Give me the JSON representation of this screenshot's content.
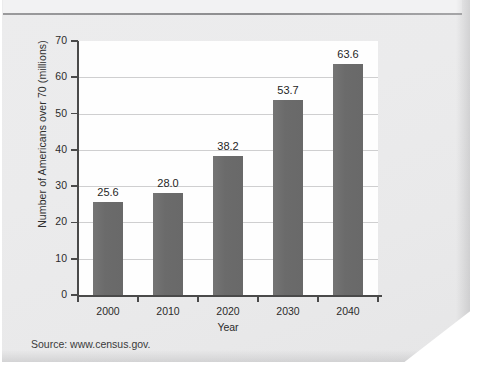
{
  "page": {
    "source_note": "Source: www.census.gov.",
    "paper_color": "#ebebec",
    "bar_color": "#6e6e6e",
    "axis_color": "#4a4a4a",
    "gridline_color": "#cfcfd0",
    "plot_background": "#fefefe"
  },
  "chart_data": {
    "type": "bar",
    "title": "",
    "xlabel": "Year",
    "ylabel": "Number of Americans over 70 (millions)",
    "categories": [
      "2000",
      "2010",
      "2020",
      "2030",
      "2040"
    ],
    "values": [
      25.6,
      28.0,
      38.2,
      53.7,
      63.6
    ],
    "value_labels": [
      "25.6",
      "28.0",
      "38.2",
      "53.7",
      "63.6"
    ],
    "ylim": [
      0,
      70
    ],
    "ytick_labels": [
      "70",
      "60",
      "50",
      "40",
      "30",
      "20",
      "10",
      "0"
    ],
    "ytick_values": [
      70,
      60,
      50,
      40,
      30,
      20,
      10,
      0
    ],
    "ytick_step": 10,
    "grid": "horizontal",
    "legend": "none"
  }
}
